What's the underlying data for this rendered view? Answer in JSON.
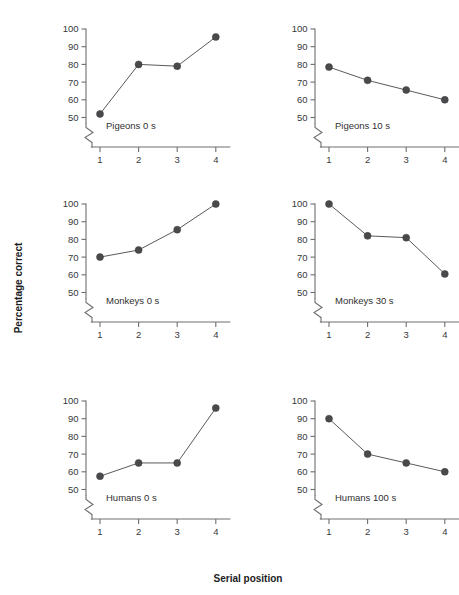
{
  "chart_data": {
    "type": "line",
    "title": "",
    "xlabel": "Serial position",
    "ylabel": "Percentage correct",
    "x": [
      1,
      2,
      3,
      4
    ],
    "xlim": [
      0.6,
      4.4
    ],
    "ylim": [
      48,
      102
    ],
    "yticks": [
      50,
      60,
      70,
      80,
      90,
      100
    ],
    "xticks": [
      1,
      2,
      3,
      4
    ],
    "xtick_labels": [
      "1",
      "2",
      "3",
      "4"
    ],
    "ytick_labels": [
      "50",
      "60",
      "70",
      "80",
      "90",
      "100"
    ],
    "grid": false,
    "legend": "none",
    "axis_break": true,
    "axis_break_note": "y-axis broken below 50",
    "layout": {
      "rows": 3,
      "cols": 2
    },
    "marker": "filled-circle",
    "series": [
      {
        "name": "Pigeons 0 s",
        "panel": 0,
        "categories": [
          1,
          2,
          3,
          4
        ],
        "values": [
          52,
          80,
          79,
          95.5
        ]
      },
      {
        "name": "Pigeons 10 s",
        "panel": 1,
        "categories": [
          1,
          2,
          3,
          4
        ],
        "values": [
          78.5,
          71,
          65.5,
          60
        ]
      },
      {
        "name": "Monkeys 0 s",
        "panel": 2,
        "categories": [
          1,
          2,
          3,
          4
        ],
        "values": [
          70,
          74,
          85.5,
          100
        ]
      },
      {
        "name": "Monkeys 30 s",
        "panel": 3,
        "categories": [
          1,
          2,
          3,
          4
        ],
        "values": [
          100,
          82,
          81,
          60.5
        ]
      },
      {
        "name": "Humans 0 s",
        "panel": 4,
        "categories": [
          1,
          2,
          3,
          4
        ],
        "values": [
          57.5,
          65,
          65,
          96
        ]
      },
      {
        "name": "Humans 100 s",
        "panel": 5,
        "categories": [
          1,
          2,
          3,
          4
        ],
        "values": [
          90,
          70,
          65,
          60
        ]
      }
    ],
    "colors": {
      "marker": "#4a4a4c",
      "line": "#5a5a5c",
      "axis": "#6e6e70",
      "text": "#38383a",
      "title_text": "#1c1c1e",
      "background": "#ffffff"
    }
  },
  "panels": [
    {
      "label": "Pigeons 0 s"
    },
    {
      "label": "Pigeons 10 s"
    },
    {
      "label": "Monkeys 0 s"
    },
    {
      "label": "Monkeys 30 s"
    },
    {
      "label": "Humans 0 s"
    },
    {
      "label": "Humans 100 s"
    }
  ],
  "axes": {
    "y_title": "Percentage correct",
    "x_title": "Serial position"
  }
}
